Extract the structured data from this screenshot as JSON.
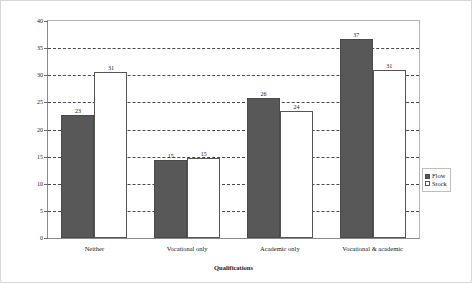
{
  "chart_data": {
    "type": "bar",
    "title": "",
    "xlabel": "Qualifications",
    "ylabel": "Percentage",
    "ylim": [
      0,
      40
    ],
    "yticks": [
      0,
      5,
      10,
      15,
      20,
      25,
      30,
      35,
      40
    ],
    "grid": true,
    "grid_style": "dashed-horizontal",
    "legend_position": "right",
    "categories": [
      "Neither",
      "Vocational only",
      "Academic only",
      "Vocational & academic"
    ],
    "series": [
      {
        "name": "Flow",
        "color": "#585858",
        "values": [
          23,
          15,
          26,
          37
        ],
        "labels": [
          "23",
          "15",
          "26",
          "37"
        ],
        "plotted": [
          22.7,
          14.4,
          25.8,
          36.7
        ]
      },
      {
        "name": "Stock",
        "color": "#ffffff",
        "values": [
          31,
          15,
          24,
          31
        ],
        "labels": [
          "31",
          "15",
          "24",
          "31"
        ],
        "plotted": [
          30.6,
          14.7,
          23.4,
          30.9
        ]
      }
    ]
  },
  "legend": {
    "items": [
      {
        "label": "Flow",
        "swatch": "filled-dark-square"
      },
      {
        "label": "Stock",
        "swatch": "outlined-white-square"
      }
    ]
  },
  "axis": {
    "y_tick_labels": [
      "40",
      "35",
      "30",
      "25",
      "20",
      "15",
      "10",
      "5",
      "0"
    ],
    "y_title": "Percentage",
    "x_title": "Qualifications"
  }
}
